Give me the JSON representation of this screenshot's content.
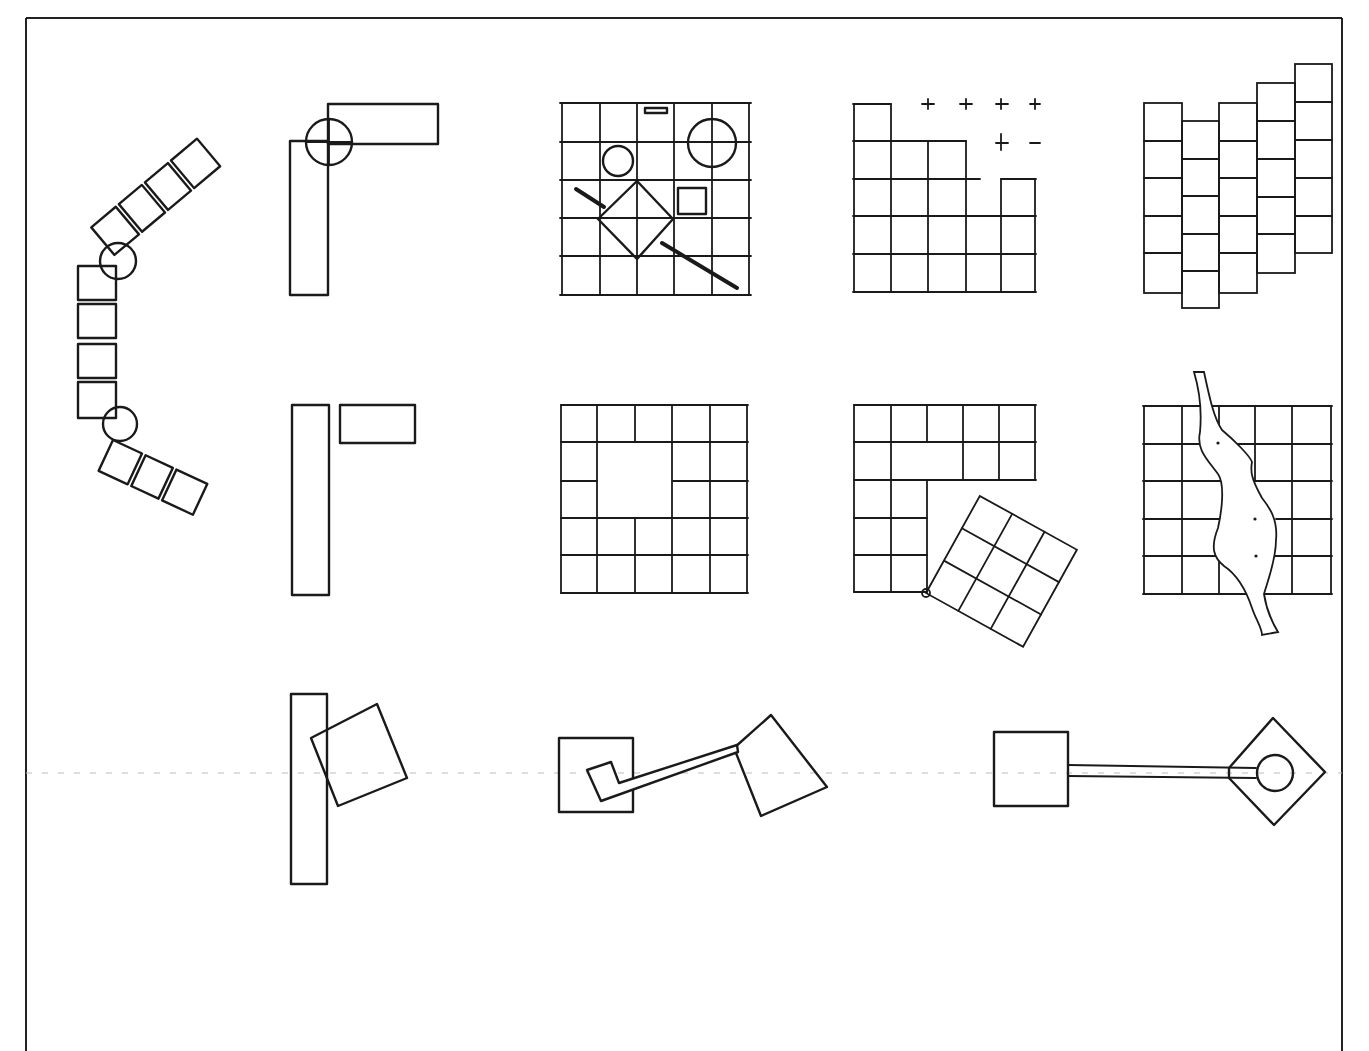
{
  "diagram": {
    "title": "",
    "ink_color": "#1a1a1a",
    "background": "#ffffff",
    "frame": {
      "x": 26,
      "y": 18,
      "w": 1316,
      "h": 1035
    },
    "guide_line_y": 773,
    "figures": [
      {
        "id": "curved-chain",
        "description": "Chain of squares bending around two circular pivots",
        "row": 1,
        "col": 0
      },
      {
        "id": "l-overlap-circle",
        "description": "Two rectangles forming an L, joined by a circle at the overlap",
        "row": 1,
        "col": 1
      },
      {
        "id": "grid-with-objects",
        "description": "5x5 grid with circles, rotated square, small square and diagonal bars",
        "row": 1,
        "col": 2
      },
      {
        "id": "grid-eroding",
        "description": "Grid eroding to the upper right, leaving marker points",
        "row": 1,
        "col": 3
      },
      {
        "id": "staggered-columns",
        "description": "Five vertically staggered strips of cells",
        "row": 1,
        "col": 4
      },
      {
        "id": "l-separated",
        "description": "Two rectangles in L arrangement, separated",
        "row": 2,
        "col": 1
      },
      {
        "id": "grid-void",
        "description": "5x5 grid with central void",
        "row": 2,
        "col": 2
      },
      {
        "id": "grid-rotated-subgrid",
        "description": "L-shaped grid with rotated 3x3 grid touching at corner",
        "row": 2,
        "col": 3
      },
      {
        "id": "grid-river",
        "description": "5x5 grid interrupted by a meandering river form",
        "row": 2,
        "col": 4
      },
      {
        "id": "bar-rotated-square",
        "description": "Tall bar overlapped by rotated square",
        "row": 3,
        "col": 1
      },
      {
        "id": "squares-linked",
        "description": "Square with inner square linked by path to rotated square",
        "row": 3,
        "col": 2
      },
      {
        "id": "square-path-diamond",
        "description": "Square linked by long path to diamond containing a circle",
        "row": 3,
        "col": 3
      }
    ]
  }
}
